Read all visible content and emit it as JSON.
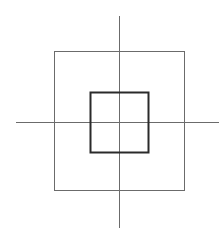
{
  "diagram": {
    "elements": [
      {
        "name": "outer-square",
        "shape": "square",
        "style": "thin"
      },
      {
        "name": "inner-square",
        "shape": "square",
        "style": "thick"
      },
      {
        "name": "horizontal-axis",
        "shape": "line"
      },
      {
        "name": "vertical-axis",
        "shape": "line"
      }
    ],
    "colors": {
      "background": "#ffffff",
      "thin_stroke": "#6b6b6b",
      "thick_stroke": "#2a2a2a"
    }
  }
}
